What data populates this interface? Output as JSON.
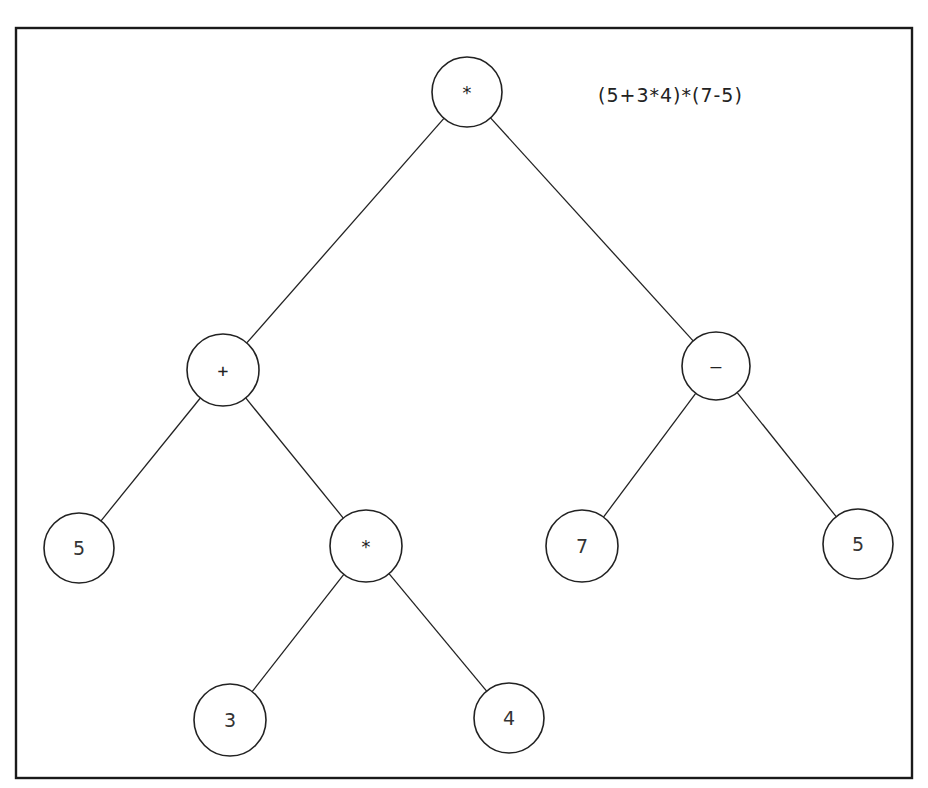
{
  "diagram": {
    "type": "expression-tree",
    "formula": "(5+3*4)*(7-5)",
    "frame": {
      "x": 16,
      "y": 28,
      "width": 896,
      "height": 750
    },
    "nodes": [
      {
        "id": "root",
        "label": "*",
        "cx": 467,
        "cy": 92,
        "r": 35,
        "kind": "operator"
      },
      {
        "id": "plus",
        "label": "+",
        "cx": 223,
        "cy": 370,
        "r": 36,
        "kind": "operator"
      },
      {
        "id": "minus",
        "label": "–",
        "cx": 716,
        "cy": 366,
        "r": 34,
        "kind": "operator"
      },
      {
        "id": "five-left",
        "label": "5",
        "cx": 79,
        "cy": 548,
        "r": 35,
        "kind": "operand"
      },
      {
        "id": "times-inner",
        "label": "*",
        "cx": 366,
        "cy": 546,
        "r": 36,
        "kind": "operator"
      },
      {
        "id": "seven",
        "label": "7",
        "cx": 582,
        "cy": 546,
        "r": 36,
        "kind": "operand"
      },
      {
        "id": "five-right",
        "label": "5",
        "cx": 858,
        "cy": 544,
        "r": 35,
        "kind": "operand"
      },
      {
        "id": "three",
        "label": "3",
        "cx": 230,
        "cy": 720,
        "r": 36,
        "kind": "operand"
      },
      {
        "id": "four",
        "label": "4",
        "cx": 509,
        "cy": 718,
        "r": 35,
        "kind": "operand"
      }
    ],
    "edges": [
      [
        "root",
        "plus"
      ],
      [
        "root",
        "minus"
      ],
      [
        "plus",
        "five-left"
      ],
      [
        "plus",
        "times-inner"
      ],
      [
        "minus",
        "seven"
      ],
      [
        "minus",
        "five-right"
      ],
      [
        "times-inner",
        "three"
      ],
      [
        "times-inner",
        "four"
      ]
    ]
  }
}
